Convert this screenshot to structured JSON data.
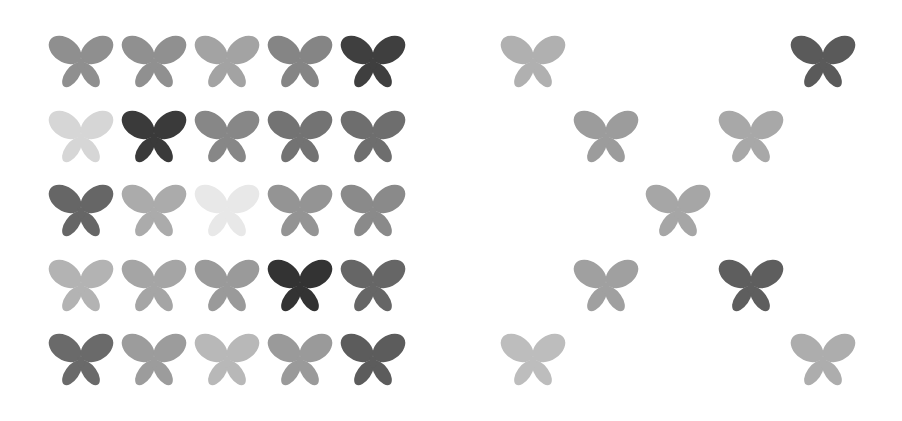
{
  "figure": {
    "panels": [
      {
        "name": "full-grid",
        "origin": [
          47,
          30
        ],
        "cols": 5,
        "rows": 5,
        "step_x": 73,
        "step_y": 74.5,
        "cells": [
          [
            {
              "r": 0,
              "c": 0,
              "shade": "#8f8f8f"
            },
            {
              "r": 0,
              "c": 1,
              "shade": "#909090"
            },
            {
              "r": 0,
              "c": 2,
              "shade": "#a3a3a3"
            },
            {
              "r": 0,
              "c": 3,
              "shade": "#858585"
            },
            {
              "r": 0,
              "c": 4,
              "shade": "#3f3f3f"
            }
          ],
          [
            {
              "r": 1,
              "c": 0,
              "shade": "#d6d6d6"
            },
            {
              "r": 1,
              "c": 1,
              "shade": "#3a3a3a"
            },
            {
              "r": 1,
              "c": 2,
              "shade": "#878787"
            },
            {
              "r": 1,
              "c": 3,
              "shade": "#737373"
            },
            {
              "r": 1,
              "c": 4,
              "shade": "#6e6e6e"
            }
          ],
          [
            {
              "r": 2,
              "c": 0,
              "shade": "#666666"
            },
            {
              "r": 2,
              "c": 1,
              "shade": "#ababab"
            },
            {
              "r": 2,
              "c": 2,
              "shade": "#e8e8e8"
            },
            {
              "r": 2,
              "c": 3,
              "shade": "#949494"
            },
            {
              "r": 2,
              "c": 4,
              "shade": "#8a8a8a"
            }
          ],
          [
            {
              "r": 3,
              "c": 0,
              "shade": "#b3b3b3"
            },
            {
              "r": 3,
              "c": 1,
              "shade": "#a5a5a5"
            },
            {
              "r": 3,
              "c": 2,
              "shade": "#9a9a9a"
            },
            {
              "r": 3,
              "c": 3,
              "shade": "#333333"
            },
            {
              "r": 3,
              "c": 4,
              "shade": "#666666"
            }
          ],
          [
            {
              "r": 4,
              "c": 0,
              "shade": "#6a6a6a"
            },
            {
              "r": 4,
              "c": 1,
              "shade": "#9c9c9c"
            },
            {
              "r": 4,
              "c": 2,
              "shade": "#b8b8b8"
            },
            {
              "r": 4,
              "c": 3,
              "shade": "#9a9a9a"
            },
            {
              "r": 4,
              "c": 4,
              "shade": "#5c5c5c"
            }
          ]
        ]
      },
      {
        "name": "x-pattern",
        "origin": [
          499,
          30
        ],
        "cols": 5,
        "rows": 5,
        "step_x": 72.5,
        "step_y": 74.5,
        "cells": [
          [
            {
              "r": 0,
              "c": 0,
              "shade": "#b0b0b0"
            },
            {
              "r": 0,
              "c": 4,
              "shade": "#5a5a5a"
            }
          ],
          [
            {
              "r": 1,
              "c": 1,
              "shade": "#9c9c9c"
            },
            {
              "r": 1,
              "c": 3,
              "shade": "#a8a8a8"
            }
          ],
          [
            {
              "r": 2,
              "c": 2,
              "shade": "#a6a6a6"
            }
          ],
          [
            {
              "r": 3,
              "c": 1,
              "shade": "#a0a0a0"
            },
            {
              "r": 3,
              "c": 3,
              "shade": "#5e5e5e"
            }
          ],
          [
            {
              "r": 4,
              "c": 0,
              "shade": "#bdbdbd"
            },
            {
              "r": 4,
              "c": 4,
              "shade": "#adadad"
            }
          ]
        ]
      }
    ]
  }
}
